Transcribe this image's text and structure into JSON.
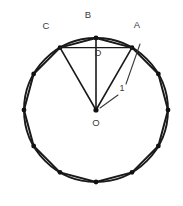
{
  "figure": {
    "colors": {
      "stroke": "#1a1a1a",
      "circle_stroke": "#1a1a1a",
      "polygon_stroke": "#1a1a1a",
      "vertex_fill": "#111111",
      "label_text": "#3a3a3a",
      "background": "#ffffff",
      "leader_stroke": "#3a3a3a"
    },
    "geometry": {
      "center": {
        "x": 96,
        "y": 110
      },
      "radius": 72,
      "polygon_sides": 12,
      "polygon_start_angle_deg": -90,
      "circle_stroke_width": 1.9,
      "polygon_stroke_width": 2.0,
      "chord_stroke_width": 1.4,
      "radius_stroke_width": 1.6,
      "vertex_radius": 2.4
    },
    "labels": [
      {
        "id": "label-A",
        "text": "A",
        "x": 137,
        "y": 28
      },
      {
        "id": "label-B",
        "text": "B",
        "x": 88,
        "y": 18
      },
      {
        "id": "label-C",
        "text": "C",
        "x": 46,
        "y": 29
      },
      {
        "id": "label-D",
        "text": "D",
        "x": 98,
        "y": 56
      },
      {
        "id": "label-O",
        "text": "O",
        "x": 96,
        "y": 126
      }
    ],
    "measurement": {
      "id": "measure-1",
      "text": "1",
      "x": 122,
      "y": 91,
      "leader_upper": {
        "x1": 126,
        "y1": 84,
        "x2": 140,
        "y2": 44
      },
      "leader_lower": {
        "x1": 118,
        "y1": 95,
        "x2": 100,
        "y2": 108
      }
    },
    "points": {
      "A": {
        "x": 132,
        "y": 46
      },
      "B": {
        "x": 96,
        "y": 38
      },
      "C": {
        "x": 60,
        "y": 46
      },
      "D": {
        "x": 96,
        "y": 46
      },
      "O": {
        "x": 96,
        "y": 110
      }
    },
    "segments": [
      {
        "id": "segment-OA",
        "from": "O",
        "to": "A"
      },
      {
        "id": "segment-OB",
        "from": "O",
        "to": "B"
      },
      {
        "id": "segment-OC",
        "from": "O",
        "to": "C"
      },
      {
        "id": "segment-CA",
        "from": "C",
        "to": "A"
      },
      {
        "id": "segment-CB",
        "from": "C",
        "to": "B"
      },
      {
        "id": "segment-BA",
        "from": "B",
        "to": "A"
      }
    ]
  }
}
